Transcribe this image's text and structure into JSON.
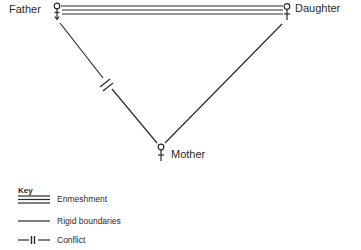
{
  "diagram": {
    "type": "family-structure",
    "nodes": [
      {
        "id": "father",
        "label": "Father",
        "symbol": "male"
      },
      {
        "id": "daughter",
        "label": "Daughter",
        "symbol": "female"
      },
      {
        "id": "mother",
        "label": "Mother",
        "symbol": "female"
      }
    ],
    "edges": [
      {
        "from": "father",
        "to": "daughter",
        "relation": "Enmeshment"
      },
      {
        "from": "father",
        "to": "mother",
        "relation": "Conflict"
      },
      {
        "from": "daughter",
        "to": "mother",
        "relation": "Rigid boundaries"
      }
    ]
  },
  "labels": {
    "father": "Father",
    "daughter": "Daughter",
    "mother": "Mother"
  },
  "key": {
    "title": "Key",
    "items": [
      {
        "label": "Enmeshment",
        "style": "triple-line"
      },
      {
        "label": "Rigid boundaries",
        "style": "single-line"
      },
      {
        "label": "Conflict",
        "style": "line-with-double-bar"
      }
    ]
  },
  "colors": {
    "line": "#2a2a2a",
    "background": "#ffffff"
  }
}
